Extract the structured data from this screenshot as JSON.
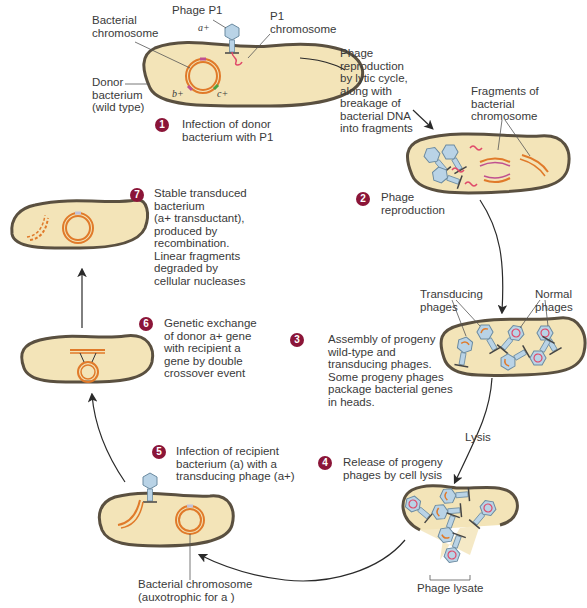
{
  "colors": {
    "cell_fill": "#f3e4b8",
    "cell_outline": "#5a5040",
    "chromosome": "#e07a2a",
    "phage_head": "#b9d3e6",
    "phage_dna": "#e04a6a",
    "step_badge": "#8b1538",
    "arrow": "#2a2a2a"
  },
  "labels": {
    "phage_p1": "Phage P1",
    "p1_chromosome": "P1\nchromosome",
    "bacterial_chromosome": "Bacterial\nchromosome",
    "donor_bacterium": "Donor\nbacterium\n(wild type)",
    "lytic_note": "Phage\nreproduction\nby lytic cycle,\nalong with\nbreakage of\nbacterial DNA\ninto fragments",
    "fragments": "Fragments of\nbacterial\nchromosome",
    "transducing_phages": "Transducing\nphages",
    "normal_phages": "Normal\nphages",
    "lysis": "Lysis",
    "phage_lysate": "Phage lysate",
    "recipient_chromosome": "Bacterial chromosome\n(auxotrophic for a )"
  },
  "genes": {
    "a_plus": "a+",
    "b_plus": "b+",
    "c_plus": "c+",
    "a": "a"
  },
  "steps": [
    {
      "num": "1",
      "text": "Infection of donor\nbacterium with P1"
    },
    {
      "num": "2",
      "text": "Phage\nreproduction"
    },
    {
      "num": "3",
      "text": "Assembly of progeny\nwild-type and\ntransducing phages.\nSome progeny phages\npackage bacterial genes\nin heads."
    },
    {
      "num": "4",
      "text": "Release of progeny\nphages by cell lysis"
    },
    {
      "num": "5",
      "text": "Infection of recipient\nbacterium (a) with a\ntransducing phage (a+)"
    },
    {
      "num": "6",
      "text": "Genetic exchange\nof donor a+ gene\nwith recipient a\ngene by double\ncrossover event"
    },
    {
      "num": "7",
      "text": "Stable transduced\nbacterium\n(a+ transductant),\nproduced by\nrecombination.\nLinear fragments\ndegraded by\ncellular nucleases"
    }
  ]
}
